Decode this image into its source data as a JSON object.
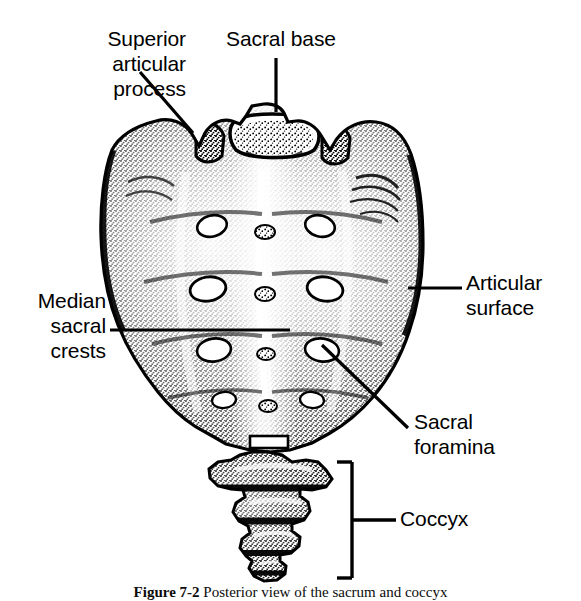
{
  "figure": {
    "style": "stippled line engraving, black and white",
    "background_color": "#ffffff",
    "ink_color": "#000000",
    "width": 581,
    "height": 599
  },
  "labels": {
    "superior_articular_process": "Superior\narticular\nprocess",
    "sacral_base": "Sacral base",
    "articular_surface": "Articular\nsurface",
    "median_sacral_crests": "Median\nsacral\ncrests",
    "sacral_foramina": "Sacral\nforamina",
    "coccyx": "Coccyx"
  },
  "caption": {
    "figure_number": "Figure 7-2",
    "text": "Posterior view of the sacrum and coccyx"
  },
  "leaders": {
    "superior_articular_process": {
      "type": "diagonal",
      "x1": 140,
      "y1": 72,
      "x2": 193,
      "y2": 133
    },
    "sacral_base": {
      "type": "vertical",
      "x1": 276,
      "y1": 58,
      "x2": 276,
      "y2": 112
    },
    "articular_surface": {
      "type": "horizontal",
      "x1": 408,
      "y1": 288,
      "x2": 462,
      "y2": 288
    },
    "median_sacral_crests": {
      "type": "horizontal",
      "x1": 110,
      "y1": 330,
      "x2": 290,
      "y2": 330
    },
    "sacral_foramina": {
      "type": "diagonal",
      "x1": 322,
      "y1": 345,
      "x2": 408,
      "y2": 428
    },
    "coccyx_bracket": {
      "type": "bracket",
      "spine_x": 352,
      "y_top": 462,
      "y_bottom": 578,
      "arm_x": 337,
      "tick_y": 520,
      "tick_x": 396
    }
  },
  "anatomy": {
    "foramina_count": 6,
    "coccyx_segments": 4,
    "view": "posterior"
  }
}
